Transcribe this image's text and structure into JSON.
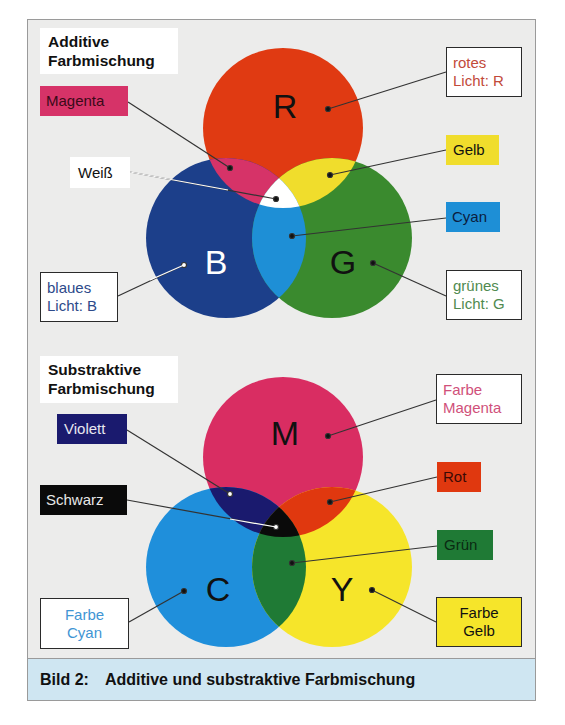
{
  "additive": {
    "title": "Additive\nFarbmischung",
    "circles": [
      {
        "letter": "R",
        "name": "rotes Licht",
        "color": "#e03a12"
      },
      {
        "letter": "B",
        "name": "blaues Licht",
        "color": "#1c3f8a"
      },
      {
        "letter": "G",
        "name": "grünes Licht",
        "color": "#3a8a2e"
      }
    ],
    "overlaps": {
      "magenta": "#d63368",
      "yellow": "#f0dd2c",
      "cyan": "#1e8fd6",
      "white": "#ffffff"
    },
    "labels": {
      "magenta": "Magenta",
      "weiss": "Weiß",
      "blue_light": "blaues\nLicht: B",
      "red_light": "rotes\nLicht: R",
      "gelb": "Gelb",
      "cyan": "Cyan",
      "green_light": "grünes\nLicht: G"
    }
  },
  "subtractive": {
    "title": "Substraktive\nFarbmischung",
    "circles": [
      {
        "letter": "M",
        "name": "Farbe Magenta",
        "color": "#d92d62"
      },
      {
        "letter": "C",
        "name": "Farbe Cyan",
        "color": "#1f8fdb"
      },
      {
        "letter": "Y",
        "name": "Farbe Gelb",
        "color": "#f6e52a"
      }
    ],
    "overlaps": {
      "violett": "#1a1a6e",
      "rot": "#e0380f",
      "gruen": "#1f7a35",
      "schwarz": "#0a0a0a"
    },
    "labels": {
      "violett": "Violett",
      "schwarz": "Schwarz",
      "farbe_cyan": "Farbe\nCyan",
      "farbe_magenta": "Farbe\nMagenta",
      "rot": "Rot",
      "gruen": "Grün",
      "farbe_gelb": "Farbe\nGelb"
    }
  },
  "caption": {
    "number": "Bild 2:",
    "text": "Additive und substraktive Farbmischung"
  }
}
